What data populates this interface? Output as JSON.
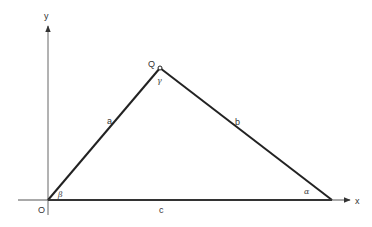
{
  "diagram": {
    "type": "triangle-in-coordinate-plane",
    "axes": {
      "x_label": "x",
      "y_label": "y",
      "origin_label": "O"
    },
    "vertices": {
      "origin": {
        "label": "O",
        "angle": "β"
      },
      "apex": {
        "label": "Q",
        "angle": "γ"
      },
      "right": {
        "label": "",
        "angle": "α"
      }
    },
    "sides": {
      "OQ": "a",
      "QR": "b",
      "OR": "c"
    },
    "colors": {
      "line": "#222222",
      "axis": "#555555",
      "background": "#ffffff"
    }
  }
}
